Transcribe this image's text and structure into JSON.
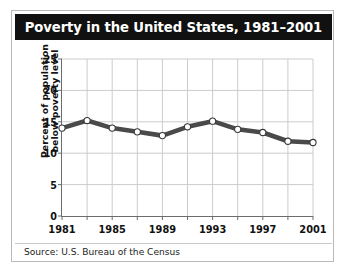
{
  "figure": {
    "title": "Poverty in the United States, 1981–2001",
    "source": "Source: U.S. Bureau of the Census"
  },
  "colors": {
    "title_bar_background": "#111111",
    "title_text": "#ffffff",
    "line": "#4a4a4a",
    "marker_fill": "#ffffff",
    "marker_edge": "#3a3a3a",
    "gridline": "#cccccc",
    "axis": "#6c6c6c",
    "panel_background": "#ffffff",
    "frame_border": "#b9b9b9"
  },
  "chart_data": {
    "type": "line",
    "title": "Poverty in the United States, 1981–2001",
    "xlabel": "",
    "ylabel": "Percent of population below poverty level",
    "ylabel_lines": [
      "Percent of population",
      "below poverty level"
    ],
    "x": [
      1981,
      1983,
      1985,
      1987,
      1989,
      1991,
      1993,
      1995,
      1997,
      1999,
      2001
    ],
    "values": [
      14.0,
      15.2,
      14.0,
      13.4,
      12.8,
      14.2,
      15.1,
      13.8,
      13.3,
      11.9,
      11.7
    ],
    "xlim": [
      1981,
      2001
    ],
    "ylim": [
      0,
      25
    ],
    "yticks": [
      0,
      5,
      10,
      15,
      20,
      25
    ],
    "ytick_labels": [
      "0",
      "5",
      "10",
      "15",
      "20",
      "25"
    ],
    "xticks": [
      1981,
      1983,
      1985,
      1987,
      1989,
      1991,
      1993,
      1995,
      1997,
      1999,
      2001
    ],
    "xtick_labels_shown": [
      "1981",
      "1985",
      "1989",
      "1993",
      "1997",
      "2001"
    ],
    "xtick_label_positions": [
      1981,
      1985,
      1989,
      1993,
      1997,
      2001
    ],
    "grid": true,
    "legend": null,
    "marker": "circle",
    "annotations": [
      "Source: U.S. Bureau of the Census"
    ]
  }
}
